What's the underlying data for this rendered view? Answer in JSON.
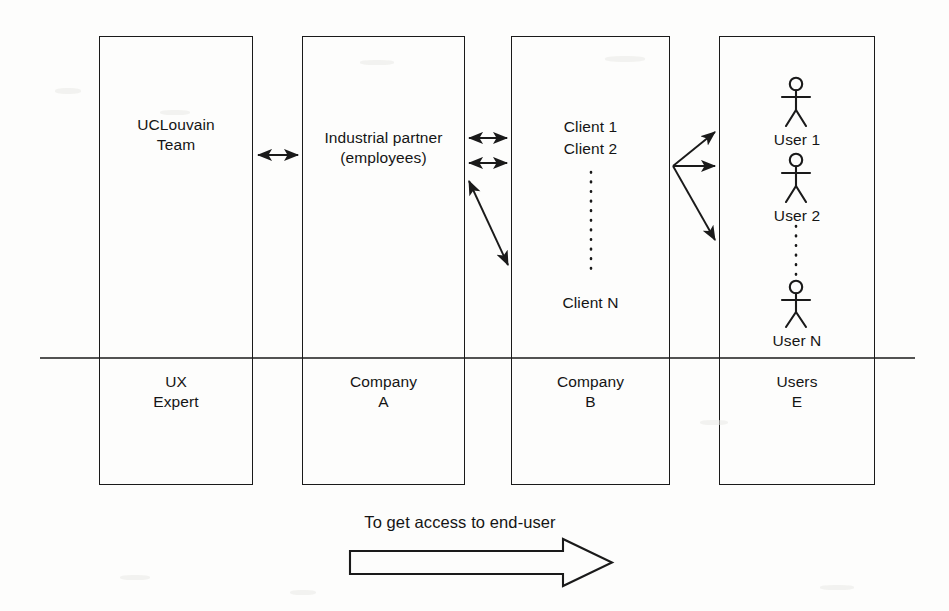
{
  "diagram": {
    "title": "To get access to end-user",
    "columns": [
      {
        "id": "uclouvain",
        "top_label": "UCLouvain\nTeam",
        "bottom_label": "UX\nExpert",
        "box": {
          "x": 99,
          "y": 36,
          "w": 154,
          "h": 449
        }
      },
      {
        "id": "industrial-partner",
        "top_label": "Industrial partner\n(employees)",
        "bottom_label": "Company\nA",
        "box": {
          "x": 302,
          "y": 36,
          "w": 163,
          "h": 449
        }
      },
      {
        "id": "clients",
        "top_label": "",
        "bottom_label": "Company\nB",
        "box": {
          "x": 511,
          "y": 36,
          "w": 159,
          "h": 449
        },
        "items": [
          "Client 1",
          "Client 2",
          "Client N"
        ],
        "ellipsis": "vertical-dotted"
      },
      {
        "id": "users",
        "top_label": "",
        "bottom_label": "Users\nE",
        "box": {
          "x": 719,
          "y": 36,
          "w": 156,
          "h": 449
        },
        "items": [
          "User 1",
          "User 2",
          "User N"
        ],
        "ellipsis": "vertical-dotted",
        "actor_icon": "stick-figure"
      }
    ],
    "connections": [
      {
        "id": "uclouvain-partner",
        "type": "double-arrow",
        "from": [
          256,
          155
        ],
        "to": [
          300,
          155
        ]
      },
      {
        "id": "partner-client-1",
        "type": "double-arrow",
        "from": [
          467,
          138
        ],
        "to": [
          509,
          138
        ]
      },
      {
        "id": "partner-client-2",
        "type": "double-arrow",
        "from": [
          467,
          163
        ],
        "to": [
          509,
          163
        ]
      },
      {
        "id": "partner-client-n",
        "type": "double-arrow-diagonal",
        "from": [
          467,
          178
        ],
        "to": [
          509,
          267
        ]
      },
      {
        "id": "client-user-1",
        "type": "arrow",
        "from": [
          672,
          166
        ],
        "to": [
          716,
          131
        ]
      },
      {
        "id": "client-user-2",
        "type": "arrow",
        "from": [
          672,
          166
        ],
        "to": [
          716,
          166
        ]
      },
      {
        "id": "client-user-n",
        "type": "arrow",
        "from": [
          672,
          166
        ],
        "to": [
          716,
          241
        ]
      }
    ],
    "divider": {
      "id": "role-divider",
      "x1": 40,
      "x2": 915,
      "y": 358
    },
    "flow_arrow": {
      "label": "To get access to end-user",
      "direction": "left-to-right",
      "x1": 350,
      "x2": 615,
      "y": 560
    },
    "colors": {
      "stroke": "#1a1a1a",
      "text": "#151515",
      "background": "#fdfdfc"
    }
  }
}
